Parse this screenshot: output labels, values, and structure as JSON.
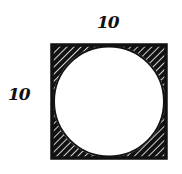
{
  "diagram": {
    "labels": {
      "top_side": "10",
      "left_side": "10"
    },
    "shapes": {
      "square": {
        "side": 10
      },
      "circle": {
        "diameter": 10,
        "inscribed": true
      },
      "shaded_regions": [
        "top-left corner",
        "top-right corner",
        "bottom-left corner",
        "bottom-right corner"
      ]
    },
    "colors": {
      "stroke": "#111111",
      "fill": "#ffffff"
    }
  }
}
